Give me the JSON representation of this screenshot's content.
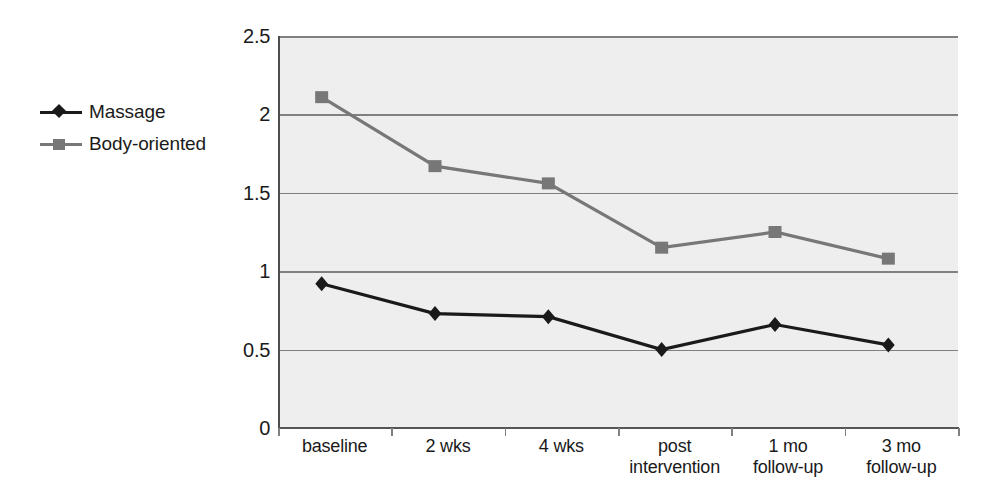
{
  "chart_data": {
    "type": "line",
    "title": "",
    "xlabel": "",
    "ylabel": "",
    "categories": [
      "baseline",
      "2 wks",
      "4 wks",
      "post\nintervention",
      "1 mo\nfollow-up",
      "3 mo\nfollow-up"
    ],
    "series": [
      {
        "name": "Massage",
        "marker": "diamond",
        "color": "#1a1a1a",
        "values": [
          0.92,
          0.73,
          0.71,
          0.5,
          0.66,
          0.53
        ]
      },
      {
        "name": "Body-oriented",
        "marker": "square",
        "color": "#777777",
        "values": [
          2.11,
          1.67,
          1.56,
          1.15,
          1.25,
          1.08
        ]
      }
    ],
    "ylim": [
      0,
      2.5
    ],
    "yticks": [
      0,
      0.5,
      1,
      1.5,
      2,
      2.5
    ],
    "ytick_labels": [
      "0",
      "0.5",
      "1",
      "1.5",
      "2",
      "2.5"
    ],
    "grid": true,
    "legend_position": "left-outside",
    "plot_background": "#eeeeee",
    "gridline_color": "#808080"
  },
  "legend": {
    "entries": [
      {
        "label": "Massage"
      },
      {
        "label": "Body-oriented"
      }
    ]
  },
  "x_axis": {
    "labels": [
      {
        "line1": "baseline",
        "line2": ""
      },
      {
        "line1": "2 wks",
        "line2": ""
      },
      {
        "line1": "4 wks",
        "line2": ""
      },
      {
        "line1": "post",
        "line2": "intervention"
      },
      {
        "line1": "1 mo",
        "line2": "follow-up"
      },
      {
        "line1": "3 mo",
        "line2": "follow-up"
      }
    ]
  },
  "y_axis": {
    "labels": [
      "2.5",
      "2",
      "1.5",
      "1",
      "0.5",
      "0"
    ]
  }
}
